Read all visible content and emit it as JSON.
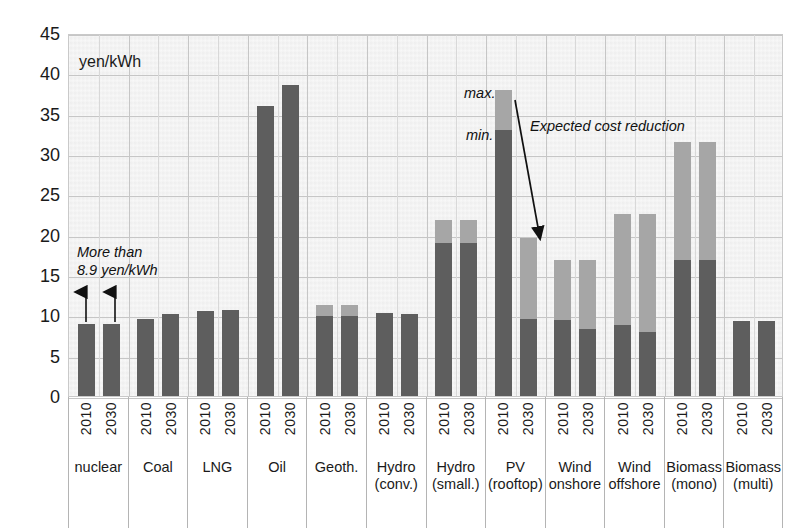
{
  "chart_data": {
    "type": "bar",
    "title": "",
    "xlabel": "",
    "ylabel": "yen/kWh",
    "unit_label": "yen/kWh",
    "ylim": [
      0,
      45
    ],
    "ytick_step": 5,
    "yticks": [
      "45",
      "40",
      "35",
      "30",
      "25",
      "20",
      "15",
      "10",
      "5",
      "0"
    ],
    "grid": true,
    "legend_position": "none",
    "bar_style": "stacked min/max range",
    "series": [
      {
        "name": "min.",
        "color": "#5e5e5e"
      },
      {
        "name": "max.",
        "color": "#a6a6a6"
      }
    ],
    "categories": [
      {
        "name": "nuclear",
        "line2": ""
      },
      {
        "name": "Coal",
        "line2": ""
      },
      {
        "name": "LNG",
        "line2": ""
      },
      {
        "name": "Oil",
        "line2": ""
      },
      {
        "name": "Geoth.",
        "line2": ""
      },
      {
        "name": "Hydro",
        "line2": "(conv.)"
      },
      {
        "name": "Hydro",
        "line2": "(small.)"
      },
      {
        "name": "PV",
        "line2": "(rooftop)"
      },
      {
        "name": "Wind",
        "line2": "onshore"
      },
      {
        "name": "Wind",
        "line2": "offshore"
      },
      {
        "name": "Biomass",
        "line2": "(mono)"
      },
      {
        "name": "Biomass",
        "line2": "(multi)"
      }
    ],
    "years": [
      "2010",
      "2030"
    ],
    "bars": [
      {
        "category": "nuclear",
        "year": "2010",
        "min": 8.9,
        "max": 8.9
      },
      {
        "category": "nuclear",
        "year": "2030",
        "min": 8.9,
        "max": 8.9
      },
      {
        "category": "Coal",
        "year": "2010",
        "min": 9.5,
        "max": 9.5
      },
      {
        "category": "Coal",
        "year": "2030",
        "min": 10.2,
        "max": 10.2
      },
      {
        "category": "LNG",
        "year": "2010",
        "min": 10.5,
        "max": 10.5
      },
      {
        "category": "LNG",
        "year": "2030",
        "min": 10.7,
        "max": 10.7
      },
      {
        "category": "Oil",
        "year": "2010",
        "min": 35.9,
        "max": 35.9
      },
      {
        "category": "Oil",
        "year": "2030",
        "min": 38.6,
        "max": 38.6
      },
      {
        "category": "Geoth.",
        "year": "2010",
        "min": 9.9,
        "max": 11.3
      },
      {
        "category": "Geoth.",
        "year": "2030",
        "min": 9.9,
        "max": 11.3
      },
      {
        "category": "Hydro (conv.)",
        "year": "2010",
        "min": 10.3,
        "max": 10.3
      },
      {
        "category": "Hydro (conv.)",
        "year": "2030",
        "min": 10.2,
        "max": 10.2
      },
      {
        "category": "Hydro (small.)",
        "year": "2010",
        "min": 19.0,
        "max": 21.8
      },
      {
        "category": "Hydro (small.)",
        "year": "2030",
        "min": 19.0,
        "max": 21.8
      },
      {
        "category": "PV (rooftop)",
        "year": "2010",
        "min": 33.0,
        "max": 37.9
      },
      {
        "category": "PV (rooftop)",
        "year": "2030",
        "min": 9.5,
        "max": 19.6
      },
      {
        "category": "Wind onshore",
        "year": "2010",
        "min": 9.4,
        "max": 16.8
      },
      {
        "category": "Wind onshore",
        "year": "2030",
        "min": 8.3,
        "max": 16.8
      },
      {
        "category": "Wind offshore",
        "year": "2010",
        "min": 8.8,
        "max": 22.6
      },
      {
        "category": "Wind offshore",
        "year": "2030",
        "min": 7.9,
        "max": 22.6
      },
      {
        "category": "Biomass (mono)",
        "year": "2010",
        "min": 16.9,
        "max": 31.5
      },
      {
        "category": "Biomass (mono)",
        "year": "2030",
        "min": 16.9,
        "max": 31.5
      },
      {
        "category": "Biomass (multi)",
        "year": "2010",
        "min": 9.3,
        "max": 9.3
      },
      {
        "category": "Biomass (multi)",
        "year": "2030",
        "min": 9.3,
        "max": 9.3
      }
    ],
    "annotations": [
      {
        "id": "more-than",
        "text_line1": "More than",
        "text_line2": "8.9 yen/kWh",
        "style": "italic",
        "has_arrows": true
      },
      {
        "id": "max-label",
        "text": "max.",
        "style": "italic"
      },
      {
        "id": "min-label",
        "text": "min.",
        "style": "italic"
      },
      {
        "id": "expected-cost-reduction",
        "text": "Expected cost reduction",
        "style": "italic",
        "has_arrow": true
      }
    ]
  },
  "colors": {
    "min_series": "#5e5e5e",
    "max_series": "#a6a6a6",
    "plot_background": "#f2f2f2",
    "gridline": "#c6c6c6",
    "text": "#1a1a1a"
  }
}
